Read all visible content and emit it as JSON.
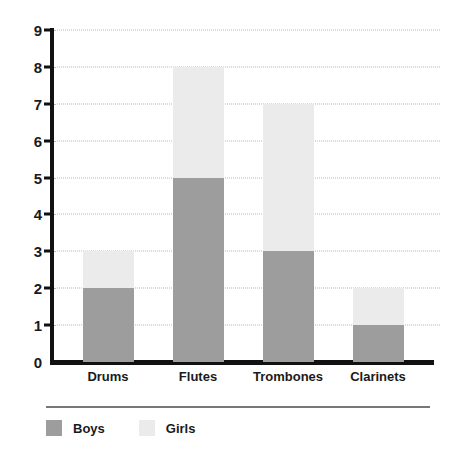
{
  "chart_data": {
    "type": "bar",
    "stacked": true,
    "title": "",
    "subtitle": "",
    "xlabel": "",
    "ylabel": "",
    "categories": [
      "Drums",
      "Flutes",
      "Trombones",
      "Clarinets"
    ],
    "series": [
      {
        "name": "Boys",
        "color": "#9d9d9d",
        "values": [
          2,
          5,
          3,
          1
        ]
      },
      {
        "name": "Girls",
        "color": "#ebebeb",
        "values": [
          1,
          3,
          4,
          1
        ]
      }
    ],
    "totals": [
      3,
      8,
      7,
      2
    ],
    "ylim": [
      0,
      9
    ],
    "ytick_labels": [
      "0",
      "1",
      "2",
      "3",
      "4",
      "5",
      "6",
      "7",
      "8",
      "9"
    ],
    "ytick_values": [
      0,
      1,
      2,
      3,
      4,
      5,
      6,
      7,
      8,
      9
    ],
    "grid": "horizontal-dotted",
    "legend_position": "bottom-left",
    "legend_entries": [
      {
        "label": "Boys",
        "color": "#9d9d9d"
      },
      {
        "label": "Girls",
        "color": "#ebebeb"
      }
    ]
  },
  "axis": {
    "line_color": "#111111",
    "grid_color": "#b8b8b8"
  },
  "legend": {
    "rule_color": "#777777"
  }
}
